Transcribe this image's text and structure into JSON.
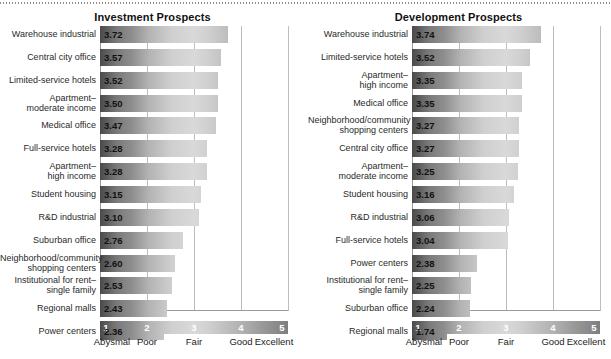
{
  "chart_data": [
    {
      "type": "bar",
      "title": "Investment Prospects",
      "orientation": "horizontal",
      "xlabel": "",
      "ylabel": "",
      "xlim": [
        1,
        5
      ],
      "grid": true,
      "gridlines": [
        1,
        2,
        3,
        4,
        5
      ],
      "tick_labels": [
        "1",
        "2",
        "3",
        "4",
        "5"
      ],
      "scale_words": [
        "Abysmal",
        "Poor",
        "Fair",
        "Good",
        "Excellent"
      ],
      "legend_position": "bottom",
      "categories": [
        "Warehouse industrial",
        "Central city office",
        "Limited-service hotels",
        "Apartment–\nmoderate income",
        "Medical office",
        "Full-service hotels",
        "Apartment–\nhigh income",
        "Student housing",
        "R&D industrial",
        "Suburban office",
        "Neighborhood/community\nshopping centers",
        "Institutional for rent–\nsingle family",
        "Regional malls",
        "Power centers"
      ],
      "values": [
        3.72,
        3.57,
        3.52,
        3.5,
        3.47,
        3.28,
        3.28,
        3.15,
        3.1,
        2.76,
        2.6,
        2.53,
        2.43,
        2.36
      ],
      "value_labels": [
        "3.72",
        "3.57",
        "3.52",
        "3.50",
        "3.47",
        "3.28",
        "3.28",
        "3.15",
        "3.10",
        "2.76",
        "2.60",
        "2.53",
        "2.43",
        "2.36"
      ]
    },
    {
      "type": "bar",
      "title": "Development Prospects",
      "orientation": "horizontal",
      "xlabel": "",
      "ylabel": "",
      "xlim": [
        1,
        5
      ],
      "grid": true,
      "gridlines": [
        1,
        2,
        3,
        4,
        5
      ],
      "tick_labels": [
        "1",
        "2",
        "3",
        "4",
        "5"
      ],
      "scale_words": [
        "Abysmal",
        "Poor",
        "Fair",
        "Good",
        "Excellent"
      ],
      "legend_position": "bottom",
      "categories": [
        "Warehouse industrial",
        "Limited-service hotels",
        "Apartment–\nhigh income",
        "Medical office",
        "Neighborhood/community\nshopping centers",
        "Central city office",
        "Apartment–\nmoderate income",
        "Student housing",
        "R&D industrial",
        "Full-service hotels",
        "Power centers",
        "Institutional for rent–\nsingle family",
        "Suburban office",
        "Regional malls"
      ],
      "values": [
        3.74,
        3.52,
        3.35,
        3.35,
        3.27,
        3.27,
        3.25,
        3.16,
        3.06,
        3.04,
        2.38,
        2.25,
        2.24,
        1.74
      ],
      "value_labels": [
        "3.74",
        "3.52",
        "3.35",
        "3.35",
        "3.27",
        "3.27",
        "3.25",
        "3.16",
        "3.06",
        "3.04",
        "2.38",
        "2.25",
        "2.24",
        "1.74"
      ]
    }
  ],
  "colors": {
    "bar_dark": "#4a4a4a",
    "bar_light": "#d9d9d9",
    "gridline": "#bdbdbd",
    "axis": "#9a9a9a",
    "text": "#1a1a1a"
  }
}
